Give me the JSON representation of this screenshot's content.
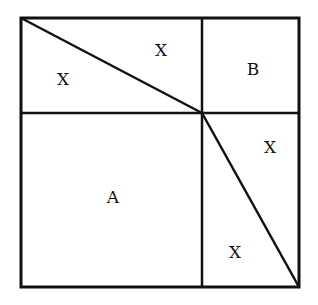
{
  "diagram": {
    "stroke_color": "#111111",
    "background": "#ffffff",
    "outer_square": {
      "x1": 21,
      "y1": 18,
      "x2": 299,
      "y2": 287
    },
    "dividers": {
      "vertical_x": 202,
      "horizontal_y": 113
    },
    "diagonals": [
      {
        "from": [
          21,
          18
        ],
        "to": [
          202,
          113
        ]
      },
      {
        "from": [
          202,
          113
        ],
        "to": [
          299,
          287
        ]
      }
    ],
    "labels": [
      {
        "id": "x-top-left-lower",
        "text": "X",
        "x": 63,
        "y": 79
      },
      {
        "id": "x-top-left-upper",
        "text": "X",
        "x": 161,
        "y": 50
      },
      {
        "id": "b",
        "text": "B",
        "x": 253,
        "y": 69
      },
      {
        "id": "x-right-upper",
        "text": "X",
        "x": 270,
        "y": 147
      },
      {
        "id": "a",
        "text": "A",
        "x": 113,
        "y": 197
      },
      {
        "id": "x-right-lower",
        "text": "X",
        "x": 235,
        "y": 252
      }
    ]
  }
}
